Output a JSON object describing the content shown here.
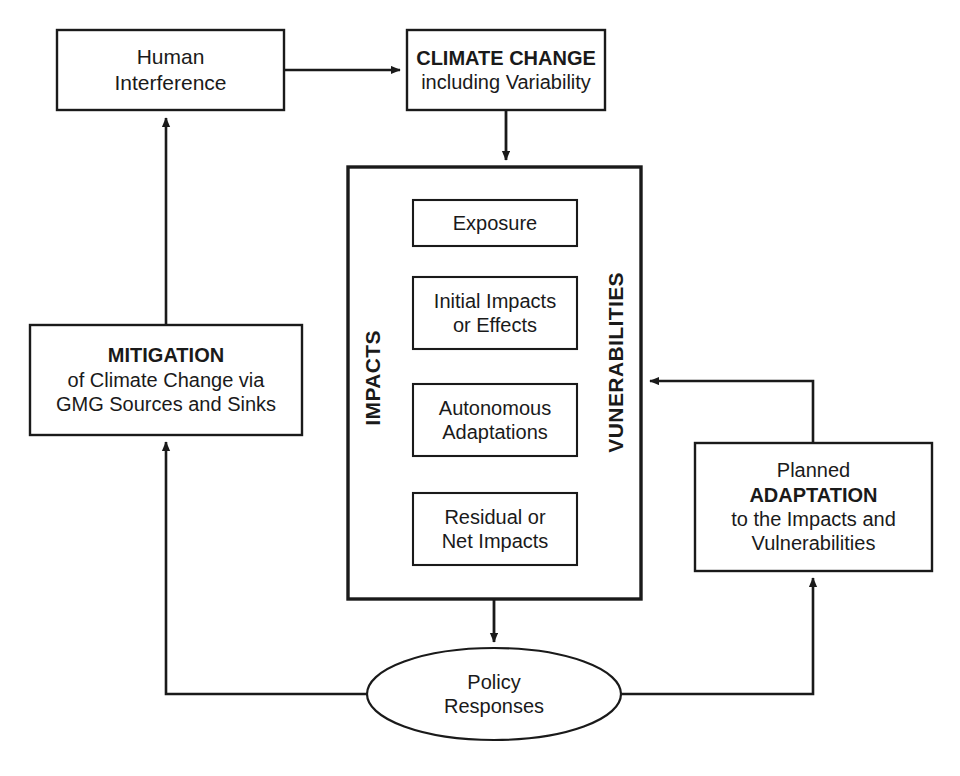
{
  "figure": {
    "type": "flow-diagram",
    "title_visible": false,
    "background_color": "#ffffff",
    "stroke_color": "#1a1a1a"
  },
  "nodes": {
    "human_interference": {
      "shape": "rectangle",
      "lines": [
        "Human",
        "Interference"
      ],
      "line1": "Human",
      "line2": "Interference",
      "bold": false
    },
    "climate_change": {
      "shape": "rectangle",
      "line1": "CLIMATE CHANGE",
      "line2": "including Variability",
      "line1_bold": true
    },
    "mitigation": {
      "shape": "rectangle",
      "line1": "MITIGATION",
      "line2": "of Climate Change via",
      "line3": "GMG Sources and Sinks",
      "line1_bold": true
    },
    "impacts_container": {
      "shape": "rectangle",
      "left_label": "IMPACTS",
      "right_label": "VUNERABILITIES"
    },
    "exposure": {
      "shape": "rectangle",
      "line1": "Exposure"
    },
    "initial_impacts": {
      "shape": "rectangle",
      "line1": "Initial Impacts",
      "line2": "or Effects"
    },
    "autonomous_adaptations": {
      "shape": "rectangle",
      "line1": "Autonomous",
      "line2": "Adaptations"
    },
    "residual_net_impacts": {
      "shape": "rectangle",
      "line1": "Residual or",
      "line2": "Net Impacts"
    },
    "planned_adaptation": {
      "shape": "rectangle",
      "line1": "Planned",
      "line2": "ADAPTATION",
      "line3": "to the Impacts and",
      "line4": "Vulnerabilities",
      "line2_bold": true
    },
    "policy_responses": {
      "shape": "ellipse",
      "line1": "Policy",
      "line2": "Responses"
    }
  },
  "edges": [
    {
      "id": "human-to-climate",
      "from": "human_interference",
      "to": "climate_change",
      "arrow": "end",
      "label": ""
    },
    {
      "id": "climate-to-impacts",
      "from": "climate_change",
      "to": "impacts_container",
      "arrow": "end",
      "label": ""
    },
    {
      "id": "impacts-to-policy",
      "from": "impacts_container",
      "to": "policy_responses",
      "arrow": "end",
      "label": ""
    },
    {
      "id": "policy-to-adaptation",
      "from": "policy_responses",
      "to": "planned_adaptation",
      "arrow": "end",
      "label": ""
    },
    {
      "id": "adaptation-to-impacts",
      "from": "planned_adaptation",
      "to": "impacts_container",
      "arrow": "end",
      "label": ""
    },
    {
      "id": "policy-to-mitigation",
      "from": "policy_responses",
      "to": "mitigation",
      "arrow": "end",
      "label": ""
    },
    {
      "id": "mitigation-to-human",
      "from": "mitigation",
      "to": "human_interference",
      "arrow": "end",
      "label": ""
    }
  ]
}
